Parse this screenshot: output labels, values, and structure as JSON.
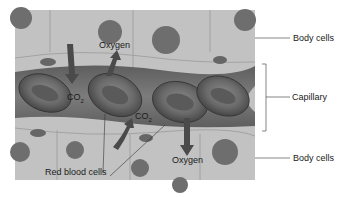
{
  "diagram": {
    "type": "biology-illustration",
    "labels": {
      "body_cells_top": "Body cells",
      "capillary": "Capillary",
      "body_cells_bottom": "Body cells",
      "oxygen_top": "Oxygen",
      "oxygen_bottom": "Oxygen",
      "co2_left": "CO",
      "co2_left_sub": "2",
      "co2_right": "CO",
      "co2_right_sub": "2",
      "red_blood_cells": "Red blood cells"
    },
    "colors": {
      "tissue": "#bdbdbd",
      "tissue_light": "#cfcfcf",
      "capillary": "#6e6e6e",
      "rbc": "#5a5a5a",
      "nucleus": "#6a6a6a",
      "arrow": "#4a4a4a",
      "line": "#333333"
    }
  }
}
